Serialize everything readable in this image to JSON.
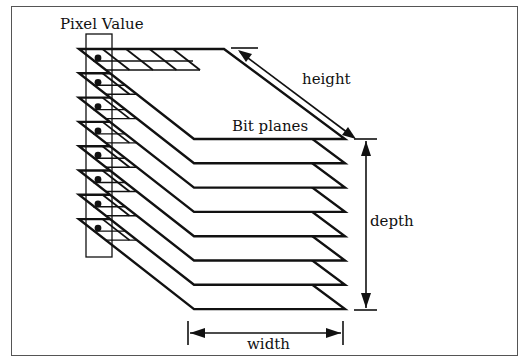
{
  "diagram": {
    "labels": {
      "pixel_value": "Pixel Value",
      "height": "height",
      "bit_planes": "Bit planes",
      "depth": "depth",
      "width": "width"
    },
    "plane_count": 8,
    "colors": {
      "stroke": "#111111",
      "background": "#ffffff",
      "frame": "#555555"
    }
  }
}
